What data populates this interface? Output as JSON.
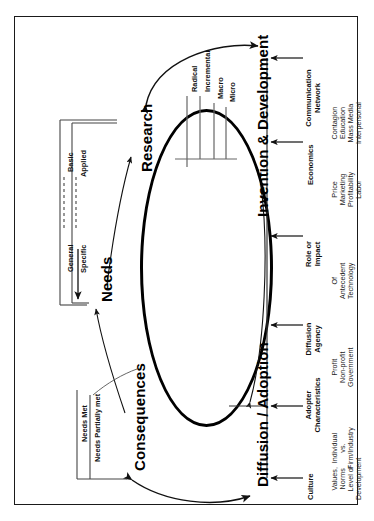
{
  "figure": {
    "orientation": "rotated-90",
    "border_color": "#1a1a1a",
    "cycle_color": "#000000"
  },
  "stages": [
    {
      "id": "research",
      "label": "Research"
    },
    {
      "id": "invention",
      "label": "Invention & Development"
    },
    {
      "id": "diffusion",
      "label": "Diffusion / Adoption"
    },
    {
      "id": "consequences",
      "label": "Consequences"
    },
    {
      "id": "needs",
      "label": "Needs"
    }
  ],
  "research_inputs": {
    "left_labels": [
      "Basic",
      "Applied"
    ],
    "right_labels": [
      "General",
      "Specific"
    ],
    "connector_style": "dashed"
  },
  "invention_ticks": [
    "Radical",
    "Incremental",
    "Macro",
    "Micro"
  ],
  "consequences_outcomes": [
    "Needs Met",
    "Needs Partially met"
  ],
  "influence_factors": [
    {
      "id": "communication-network",
      "heading": "Communication Network",
      "items": [
        "Contagion",
        "Education",
        "Mass Media",
        "Interpersonal"
      ]
    },
    {
      "id": "economics",
      "heading": "Economics",
      "items": [
        "Price",
        "Marketing",
        "Profitability",
        "Labor"
      ]
    },
    {
      "id": "role-or-impact",
      "heading": "Role or Impact",
      "items": [
        "Of",
        "Antecedent",
        "Technology"
      ]
    },
    {
      "id": "diffusion-agency",
      "heading": "Diffusion Agency",
      "items": [
        "Profit",
        "Non-profit",
        "Government"
      ]
    },
    {
      "id": "adopter-characteristics",
      "heading": "Adopter Characteristics",
      "items": [
        "Individual",
        "vs.",
        "Firm/Industry"
      ]
    },
    {
      "id": "culture",
      "heading": "Culture",
      "items": [
        "Values,",
        "Norms",
        "Level of",
        "Development"
      ]
    }
  ],
  "arrows": {
    "research_to_invention": "double-headed-curve",
    "consequences_to_diffusion": "double-headed-curve",
    "consequences_to_needs": "single-curve",
    "needs_to_research": "single-curve",
    "diffusion_to_invention": "single-curve-along-oval"
  }
}
